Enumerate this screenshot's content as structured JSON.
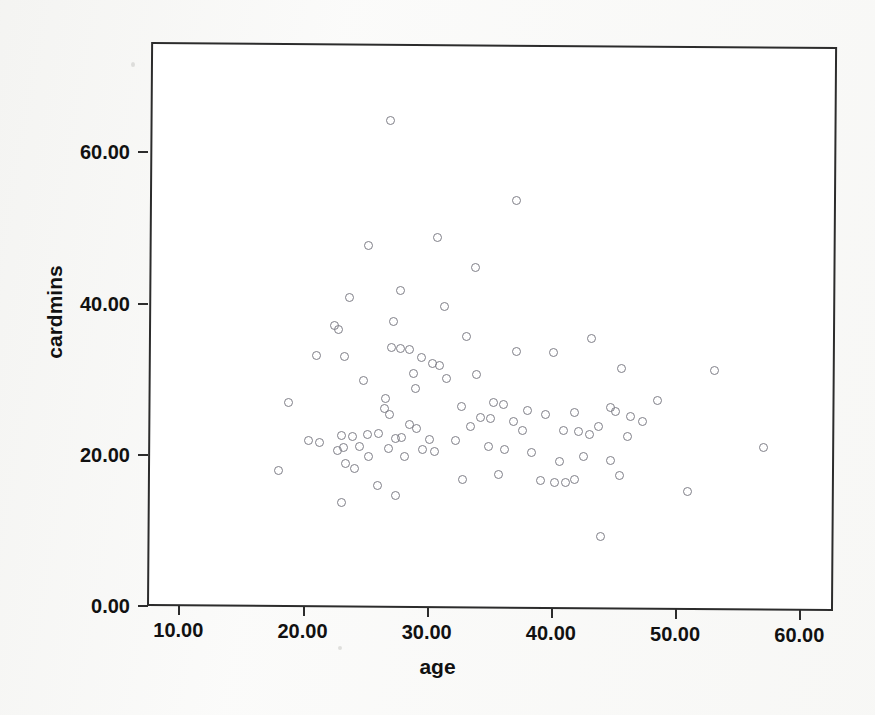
{
  "chart_data": {
    "type": "scatter",
    "title": "",
    "xlabel": "age",
    "ylabel": "cardmins",
    "xlim": [
      7.4,
      62.7
    ],
    "ylim": [
      0.0,
      67.0
    ],
    "xticks": [
      "10.00",
      "20.00",
      "30.00",
      "40.00",
      "50.00",
      "60.00"
    ],
    "xtick_values": [
      10,
      20,
      30,
      40,
      50,
      60
    ],
    "yticks": [
      "0.00",
      "20.00",
      "40.00",
      "60.00"
    ],
    "ytick_values": [
      0,
      20,
      40,
      60
    ],
    "grid": false,
    "legend": null,
    "marker": "open-circle",
    "marker_color": "#7f7f88",
    "frame_color": "#2c2c2c",
    "background": "#ffffff",
    "n_points": 97,
    "points": [
      [
        27.1,
        64.3
      ],
      [
        37.2,
        53.9
      ],
      [
        25.3,
        47.8
      ],
      [
        30.9,
        48.9
      ],
      [
        33.9,
        44.9
      ],
      [
        27.9,
        41.9
      ],
      [
        23.8,
        40.9
      ],
      [
        31.4,
        39.8
      ],
      [
        27.3,
        37.8
      ],
      [
        22.6,
        37.2
      ],
      [
        22.9,
        36.6
      ],
      [
        33.2,
        35.8
      ],
      [
        43.3,
        35.7
      ],
      [
        37.2,
        33.9
      ],
      [
        40.2,
        33.8
      ],
      [
        27.2,
        34.3
      ],
      [
        27.9,
        34.2
      ],
      [
        28.6,
        34.0
      ],
      [
        21.1,
        33.2
      ],
      [
        23.4,
        33.1
      ],
      [
        29.6,
        33.0
      ],
      [
        30.5,
        32.2
      ],
      [
        31.0,
        32.0
      ],
      [
        45.7,
        31.8
      ],
      [
        53.2,
        31.6
      ],
      [
        24.9,
        29.9
      ],
      [
        29.1,
        28.9
      ],
      [
        26.7,
        27.6
      ],
      [
        48.6,
        27.5
      ],
      [
        18.9,
        26.9
      ],
      [
        32.8,
        26.5
      ],
      [
        35.4,
        27.1
      ],
      [
        36.2,
        26.9
      ],
      [
        38.1,
        26.1
      ],
      [
        26.6,
        26.2
      ],
      [
        44.8,
        26.6
      ],
      [
        45.2,
        26.0
      ],
      [
        39.6,
        25.6
      ],
      [
        41.9,
        25.9
      ],
      [
        46.4,
        25.4
      ],
      [
        27.0,
        25.4
      ],
      [
        34.3,
        25.1
      ],
      [
        35.1,
        25.0
      ],
      [
        47.4,
        24.7
      ],
      [
        33.5,
        23.9
      ],
      [
        28.6,
        24.1
      ],
      [
        29.2,
        23.6
      ],
      [
        37.7,
        23.5
      ],
      [
        41.0,
        23.5
      ],
      [
        42.2,
        23.4
      ],
      [
        43.1,
        23.0
      ],
      [
        26.1,
        22.9
      ],
      [
        25.2,
        22.7
      ],
      [
        23.1,
        22.6
      ],
      [
        24.0,
        22.5
      ],
      [
        28.0,
        22.4
      ],
      [
        27.5,
        22.2
      ],
      [
        30.2,
        22.1
      ],
      [
        20.5,
        21.9
      ],
      [
        21.4,
        21.7
      ],
      [
        57.1,
        21.4
      ],
      [
        24.6,
        21.2
      ],
      [
        23.3,
        21.0
      ],
      [
        22.8,
        20.6
      ],
      [
        26.9,
        20.9
      ],
      [
        29.7,
        20.8
      ],
      [
        36.3,
        20.9
      ],
      [
        35.0,
        21.3
      ],
      [
        38.4,
        20.6
      ],
      [
        42.6,
        20.0
      ],
      [
        44.8,
        19.6
      ],
      [
        40.7,
        19.4
      ],
      [
        25.3,
        19.8
      ],
      [
        28.2,
        19.9
      ],
      [
        30.6,
        20.6
      ],
      [
        18.1,
        17.9
      ],
      [
        23.5,
        18.9
      ],
      [
        24.2,
        18.3
      ],
      [
        32.9,
        16.9
      ],
      [
        35.8,
        17.6
      ],
      [
        39.2,
        16.8
      ],
      [
        40.3,
        16.6
      ],
      [
        41.2,
        16.6
      ],
      [
        41.9,
        17.0
      ],
      [
        45.5,
        17.6
      ],
      [
        26.0,
        16.0
      ],
      [
        23.1,
        13.8
      ],
      [
        27.5,
        14.7
      ],
      [
        51.0,
        15.6
      ],
      [
        44.0,
        9.5
      ],
      [
        28.9,
        30.9
      ],
      [
        31.6,
        30.2
      ],
      [
        34.0,
        30.8
      ],
      [
        37.0,
        24.6
      ],
      [
        43.8,
        24.0
      ],
      [
        46.2,
        22.8
      ],
      [
        32.3,
        22.0
      ]
    ]
  },
  "axes": {
    "x_axis_name": "age",
    "y_axis_name": "cardmins"
  }
}
